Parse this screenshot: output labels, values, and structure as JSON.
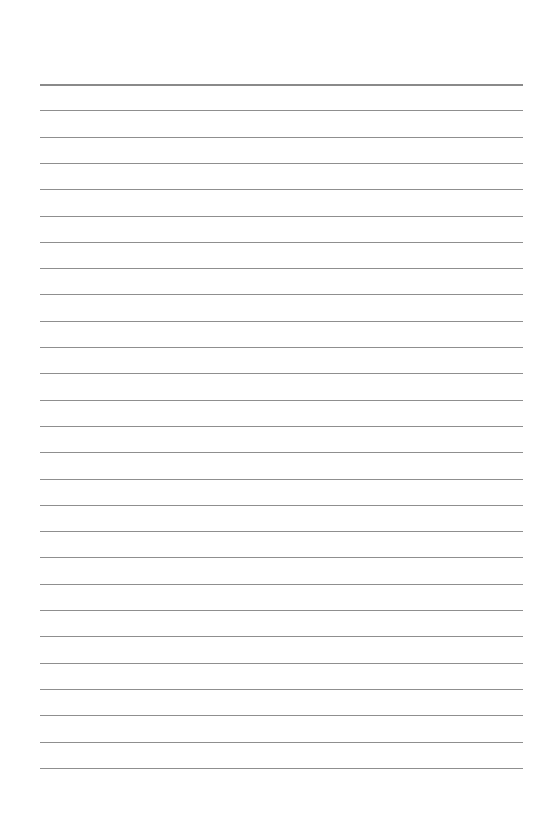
{
  "page": {
    "type": "lined-paper",
    "line_count": 27,
    "first_line_y": 84,
    "line_spacing": 26.3,
    "line_left": 40,
    "line_width": 483,
    "line_color": "#8f8f8f",
    "header_line_color": "#8a8a8a",
    "background": "#ffffff"
  }
}
